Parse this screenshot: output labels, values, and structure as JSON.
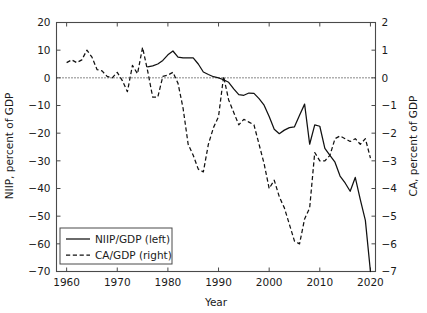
{
  "chart_data": {
    "type": "line",
    "title": "",
    "xlabel": "Year",
    "ylabel": "NIIP, percent of GDP",
    "ylabel_right": "CA, percent of GDP",
    "xlim": [
      1958,
      2021
    ],
    "ylim": [
      -70,
      20
    ],
    "ylim_right": [
      -7,
      2
    ],
    "grid": false,
    "zero_reference_line": true,
    "legend_position": "bottom-left",
    "xticks": [
      1960,
      1970,
      1980,
      1990,
      2000,
      2010,
      2020
    ],
    "xtick_labels": [
      "1960",
      "1970",
      "1980",
      "1990",
      "2000",
      "2010",
      "2020"
    ],
    "yticks": [
      20,
      10,
      0,
      -10,
      -20,
      -30,
      -40,
      -50,
      -60,
      -70
    ],
    "ytick_labels": [
      "20",
      "10",
      "0",
      "−10",
      "−20",
      "−30",
      "−40",
      "−50",
      "−60",
      "−70"
    ],
    "yticks_right": [
      2,
      1,
      0,
      -1,
      -2,
      -3,
      -4,
      -5,
      -6,
      -7
    ],
    "ytick_labels_right": [
      "2",
      "1",
      "0",
      "−1",
      "−2",
      "−3",
      "−4",
      "−5",
      "−6",
      "−7"
    ],
    "series": [
      {
        "name": "NIIP/GDP (left)",
        "axis": "left",
        "style": "solid",
        "color": "#111111",
        "x": [
          1976,
          1977,
          1978,
          1979,
          1980,
          1981,
          1982,
          1983,
          1984,
          1985,
          1986,
          1987,
          1988,
          1989,
          1990,
          1991,
          1992,
          1993,
          1994,
          1995,
          1996,
          1997,
          1998,
          1999,
          2000,
          2001,
          2002,
          2003,
          2004,
          2005,
          2006,
          2007,
          2008,
          2009,
          2010,
          2011,
          2012,
          2013,
          2014,
          2015,
          2016,
          2017,
          2018,
          2019,
          2020
        ],
        "y": [
          4.0,
          4.3,
          5.0,
          6.3,
          8.3,
          9.7,
          7.5,
          7.2,
          7.2,
          7.2,
          5.0,
          2.1,
          1.2,
          0.4,
          0.0,
          -0.7,
          -1.6,
          -4.0,
          -6.1,
          -6.3,
          -5.5,
          -5.6,
          -7.5,
          -9.9,
          -14.0,
          -18.6,
          -20.2,
          -18.9,
          -18.0,
          -17.7,
          -13.5,
          -9.5,
          -24.0,
          -17.0,
          -17.5,
          -25.5,
          -28.0,
          -30.5,
          -35.5,
          -38.0,
          -41.0,
          -36.0,
          -44.0,
          -51.5,
          -70.0
        ]
      },
      {
        "name": "CA/GDP (right)",
        "axis": "right",
        "style": "dashed",
        "color": "#111111",
        "x": [
          1960,
          1961,
          1962,
          1963,
          1964,
          1965,
          1966,
          1967,
          1968,
          1969,
          1970,
          1971,
          1972,
          1973,
          1974,
          1975,
          1976,
          1977,
          1978,
          1979,
          1980,
          1981,
          1982,
          1983,
          1984,
          1985,
          1986,
          1987,
          1988,
          1989,
          1990,
          1991,
          1992,
          1993,
          1994,
          1995,
          1996,
          1997,
          1998,
          1999,
          2000,
          2001,
          2002,
          2003,
          2004,
          2005,
          2006,
          2007,
          2008,
          2009,
          2010,
          2011,
          2012,
          2013,
          2014,
          2015,
          2016,
          2017,
          2018,
          2019,
          2020
        ],
        "y": [
          0.55,
          0.65,
          0.55,
          0.65,
          1.0,
          0.75,
          0.3,
          0.25,
          0.05,
          0.0,
          0.2,
          -0.1,
          -0.5,
          0.45,
          0.15,
          1.1,
          0.25,
          -0.7,
          -0.7,
          0.05,
          0.1,
          0.2,
          -0.2,
          -1.1,
          -2.4,
          -2.8,
          -3.3,
          -3.4,
          -2.4,
          -1.8,
          -1.4,
          0.05,
          -0.8,
          -1.25,
          -1.7,
          -1.5,
          -1.6,
          -1.7,
          -2.4,
          -3.1,
          -4.0,
          -3.7,
          -4.3,
          -4.7,
          -5.3,
          -5.9,
          -6.0,
          -5.1,
          -4.7,
          -2.7,
          -3.0,
          -3.0,
          -2.8,
          -2.2,
          -2.1,
          -2.2,
          -2.3,
          -2.2,
          -2.4,
          -2.2,
          -2.9
        ]
      }
    ],
    "legend_entries": [
      {
        "label": "NIIP/GDP (left)",
        "style": "solid"
      },
      {
        "label": "CA/GDP (right)",
        "style": "dashed"
      }
    ]
  }
}
